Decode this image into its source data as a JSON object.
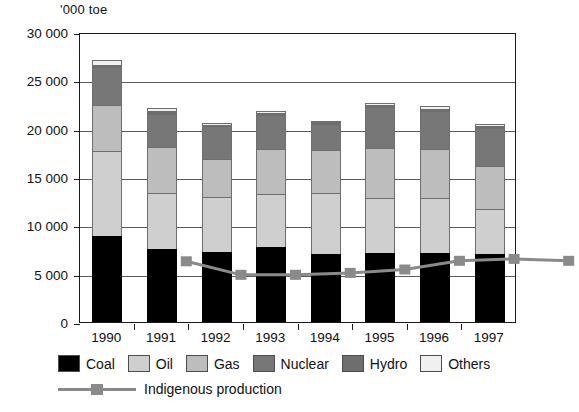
{
  "chart_data": {
    "type": "bar",
    "stacked": true,
    "title": "",
    "ylabel": "'000 toe",
    "xlabel": "",
    "categories": [
      "1990",
      "1991",
      "1992",
      "1993",
      "1994",
      "1995",
      "1996",
      "1997"
    ],
    "ylim": [
      0,
      30000
    ],
    "yticks": [
      0,
      5000,
      10000,
      15000,
      20000,
      25000,
      30000
    ],
    "ytick_labels": [
      "0",
      "5 000",
      "10 000",
      "15 000",
      "20 000",
      "25 000",
      "30 000"
    ],
    "grid": true,
    "legend_position": "bottom",
    "series": [
      {
        "name": "Coal",
        "color": "#000000",
        "values": [
          8900,
          7600,
          7200,
          7800,
          7000,
          7100,
          7150,
          7050
        ]
      },
      {
        "name": "Oil",
        "color": "#cfcfcf",
        "values": [
          8800,
          5700,
          5750,
          5400,
          6300,
          5700,
          5700,
          4650
        ]
      },
      {
        "name": "Gas",
        "color": "#bdbdbd",
        "values": [
          4750,
          4850,
          3900,
          4700,
          4500,
          5200,
          5000,
          4400
        ]
      },
      {
        "name": "Nuclear",
        "color": "#777777",
        "values": [
          3900,
          3350,
          3400,
          3550,
          2700,
          4200,
          4000,
          4000
        ]
      },
      {
        "name": "Hydro",
        "color": "#6e6e6e",
        "values": [
          250,
          300,
          150,
          200,
          180,
          250,
          200,
          200
        ]
      },
      {
        "name": "Others",
        "color": "#f0f0f0",
        "values": [
          500,
          300,
          200,
          200,
          150,
          200,
          250,
          150
        ]
      }
    ],
    "overlay_line": {
      "name": "Indigenous production",
      "color": "#8a8a8a",
      "marker": "square",
      "values": [
        9900,
        8500,
        8500,
        8700,
        9050,
        9950,
        10150,
        9950
      ]
    }
  },
  "legend": {
    "items": [
      {
        "label": "Coal"
      },
      {
        "label": "Oil"
      },
      {
        "label": "Gas"
      },
      {
        "label": "Nuclear"
      },
      {
        "label": "Hydro"
      },
      {
        "label": "Others"
      }
    ],
    "line_label": "Indigenous production"
  }
}
